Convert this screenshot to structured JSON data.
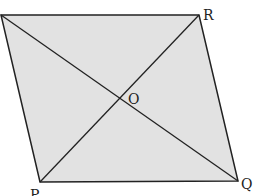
{
  "figure": {
    "fill_color": "#e2e2e2",
    "stroke_color": "#222222",
    "vertices": {
      "top_left": {
        "label": "",
        "x": 1,
        "y": 15
      },
      "R": {
        "label": "R",
        "x": 199,
        "y": 15
      },
      "Q": {
        "label": "Q",
        "x": 238,
        "y": 181
      },
      "P": {
        "label": "P",
        "x": 40,
        "y": 182
      }
    },
    "intersection": {
      "label": "O",
      "x": 119,
      "y": 99
    },
    "labels": {
      "R": "R",
      "Q": "Q",
      "P": "P",
      "O": "O"
    }
  }
}
